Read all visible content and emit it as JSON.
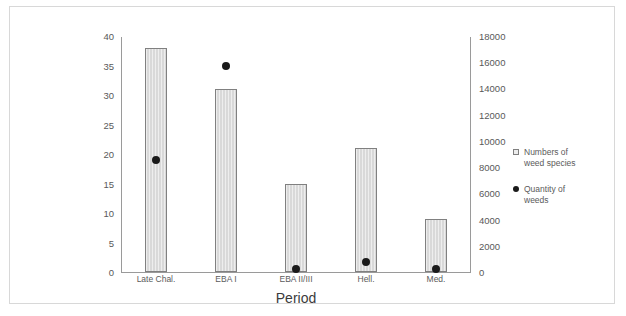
{
  "chart_data": {
    "type": "bar",
    "title": "",
    "subtitle": "",
    "xlabel": "Period",
    "ylabel": "",
    "categories": [
      "Late Chal.",
      "EBA I",
      "EBA II/III",
      "Hell.",
      "Med."
    ],
    "grid": false,
    "legend_position": "right",
    "axes": {
      "left": {
        "label": "",
        "min": 0,
        "max": 40,
        "step": 5,
        "ticks": [
          "0",
          "5",
          "10",
          "15",
          "20",
          "25",
          "30",
          "35",
          "40"
        ],
        "tick_values": [
          0,
          5,
          10,
          15,
          20,
          25,
          30,
          35,
          40
        ]
      },
      "right": {
        "label": "",
        "min": 0,
        "max": 18000,
        "step": 2000,
        "ticks": [
          "0",
          "2000",
          "4000",
          "6000",
          "8000",
          "10000",
          "12000",
          "14000",
          "16000",
          "18000"
        ],
        "tick_values": [
          0,
          2000,
          4000,
          6000,
          8000,
          10000,
          12000,
          14000,
          16000,
          18000
        ]
      }
    },
    "series": [
      {
        "name": "Numbers of weed species",
        "type": "bar",
        "axis": "left",
        "marker": "square",
        "color": "#d9d9d9",
        "edge_color": "#808080",
        "values": [
          38,
          31,
          15,
          21,
          9
        ]
      },
      {
        "name": "Quantity of weeds",
        "type": "scatter",
        "axis": "right",
        "marker": "dot",
        "color": "#1a1a1a",
        "values": [
          8630,
          15780,
          300,
          850,
          300
        ]
      }
    ]
  },
  "legend": {
    "items": [
      {
        "label_line1": "Numbers of",
        "label_line2": "weed species",
        "marker": "square-marker"
      },
      {
        "label_line1": "Quantity of",
        "label_line2": "weeds",
        "marker": "dot-marker"
      }
    ]
  },
  "frame": {
    "border_color": "#d8d8d8",
    "background": "#ffffff"
  }
}
